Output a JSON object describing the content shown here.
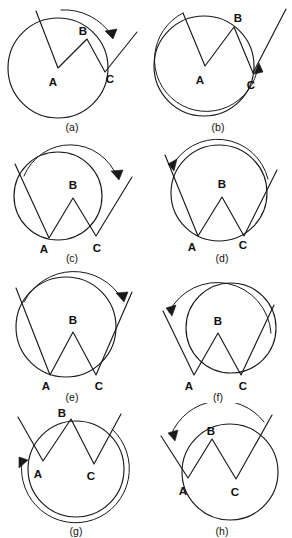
{
  "figure": {
    "background_color": "#ffffff",
    "stroke_color": "#1a1a1a",
    "width": 292,
    "height": 538,
    "columns": 2,
    "rows": 4
  },
  "vertex_labels": {
    "a": "A",
    "b": "B",
    "c": "C"
  },
  "panels": [
    {
      "id": "a",
      "caption": "(a)",
      "vertex_a": "A",
      "vertex_b": "B",
      "vertex_c": "C",
      "arrow_direction": "clockwise",
      "arc_span": "near-full-circle",
      "circle_center_label": "A"
    },
    {
      "id": "b",
      "caption": "(b)",
      "vertex_a": "A",
      "vertex_b": "B",
      "vertex_c": "C",
      "arrow_direction": "counterclockwise",
      "arc_span": "near-full-circle",
      "circle_center_label": "A"
    },
    {
      "id": "c",
      "caption": "(c)",
      "vertex_a": "A",
      "vertex_b": "B",
      "vertex_c": "C",
      "arrow_direction": "clockwise",
      "arc_span": "major-arc",
      "circle_center_label": "A"
    },
    {
      "id": "d",
      "caption": "(d)",
      "vertex_a": "A",
      "vertex_b": "B",
      "vertex_c": "C",
      "arrow_direction": "counterclockwise",
      "arc_span": "major-arc",
      "circle_center_label": "A"
    },
    {
      "id": "e",
      "caption": "(e)",
      "vertex_a": "A",
      "vertex_b": "B",
      "vertex_c": "C",
      "arrow_direction": "clockwise",
      "arc_span": "near-full-circle",
      "circle_center_label": "C"
    },
    {
      "id": "f",
      "caption": "(f)",
      "vertex_a": "A",
      "vertex_b": "B",
      "vertex_c": "C",
      "arrow_direction": "counterclockwise",
      "arc_span": "major-arc",
      "circle_center_label": "C"
    },
    {
      "id": "g",
      "caption": "(g)",
      "vertex_a": "A",
      "vertex_b": "B",
      "vertex_c": "C",
      "arrow_direction": "counterclockwise",
      "arc_span": "near-full-circle",
      "circle_center_label": "C"
    },
    {
      "id": "h",
      "caption": "(h)",
      "vertex_a": "A",
      "vertex_b": "B",
      "vertex_c": "C",
      "arrow_direction": "counterclockwise",
      "arc_span": "near-full-circle",
      "circle_center_label": "C"
    }
  ]
}
